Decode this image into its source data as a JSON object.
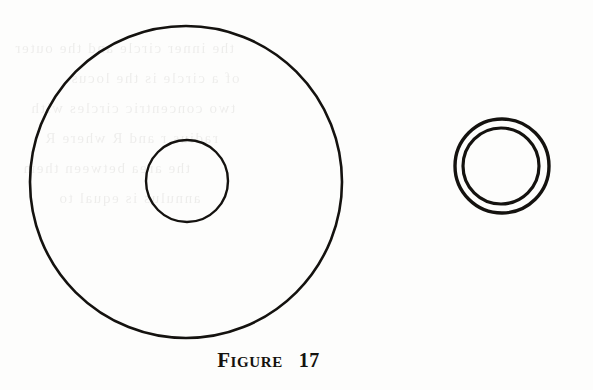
{
  "page": {
    "background_color": "#fdfdfc",
    "ink_color": "#14120f",
    "width": 593,
    "height": 390
  },
  "caption": {
    "label": "Figure",
    "number": "17",
    "full_text": "FIGURE 17"
  },
  "bleed_through": {
    "note": "faint illegible mirrored text showing through from the reverse page",
    "lines": [
      {
        "text": "the     inner     circle     and     the     outer",
        "x": 14,
        "y": 46
      },
      {
        "text": "of     a     circle     is     the     locus",
        "x": 70,
        "y": 76
      },
      {
        "text": "two     concentric     circles     with",
        "x": 30,
        "y": 106
      },
      {
        "text": "radius     r     and     R     where     R",
        "x": 44,
        "y": 136
      },
      {
        "text": "the     area     between     them",
        "x": 22,
        "y": 166
      },
      {
        "text": "annulus     is     equal     to",
        "x": 58,
        "y": 196
      }
    ]
  },
  "chart_data": {
    "type": "diagram",
    "units": "pixels",
    "shapes": [
      {
        "name": "large-outer-circle",
        "group": "left-figure",
        "type": "circle",
        "cx": 186,
        "cy": 182,
        "r": 156,
        "stroke": "#14120f",
        "stroke_width": 2.6,
        "fill": "none"
      },
      {
        "name": "large-inner-circle",
        "group": "left-figure",
        "type": "circle",
        "cx": 187,
        "cy": 181,
        "r": 41,
        "stroke": "#14120f",
        "stroke_width": 2.4,
        "fill": "none"
      },
      {
        "name": "small-outer-circle",
        "group": "right-figure",
        "type": "circle",
        "cx": 502,
        "cy": 166,
        "r": 47,
        "stroke": "#14120f",
        "stroke_width": 3.4,
        "fill": "none"
      },
      {
        "name": "small-inner-circle",
        "group": "right-figure",
        "type": "circle",
        "cx": 501,
        "cy": 166,
        "r": 38,
        "stroke": "#14120f",
        "stroke_width": 3.2,
        "fill": "none"
      }
    ]
  }
}
